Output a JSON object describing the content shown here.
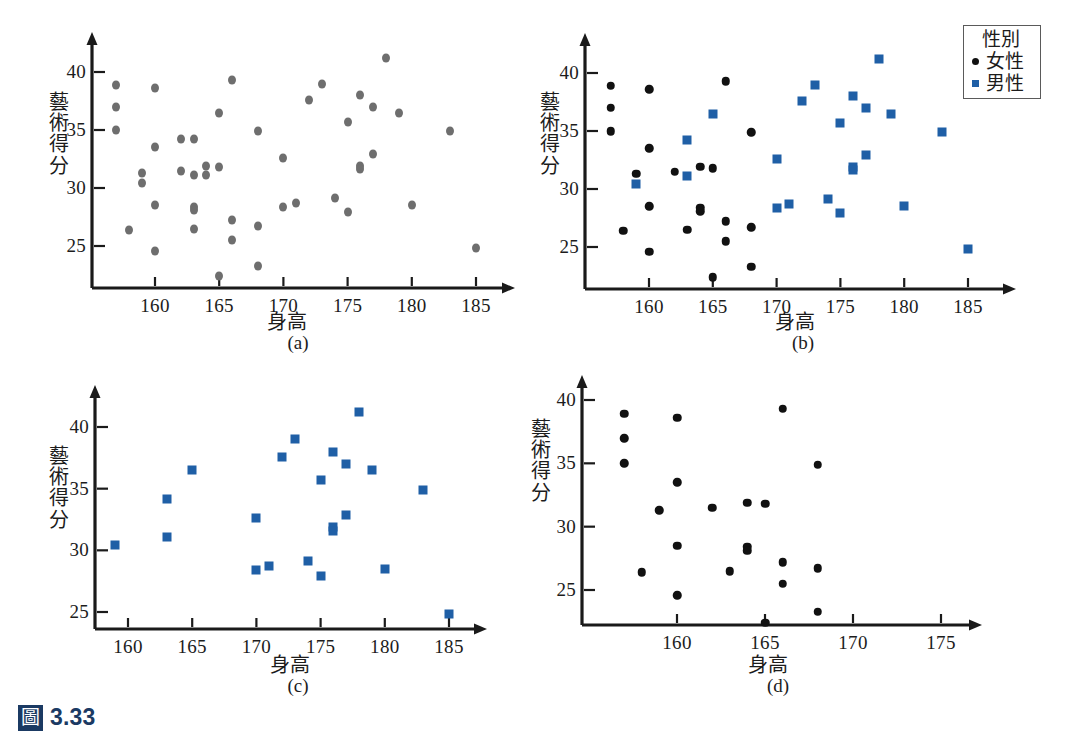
{
  "figure": {
    "badge": "圖",
    "number": "3.33"
  },
  "labels": {
    "x_title": "身高",
    "y_title": "藝術得分",
    "y_title_chars": [
      "藝",
      "術",
      "得",
      "分"
    ]
  },
  "legend": {
    "title": "性別",
    "entries": [
      {
        "label": "女性",
        "marker": "dot",
        "color": "#111111"
      },
      {
        "label": "男性",
        "marker": "square",
        "color": "#1f5fa6"
      }
    ]
  },
  "colors": {
    "grey_marker": "#6e6e6e",
    "black_marker": "#111111",
    "blue_marker": "#1f5fa6",
    "axis": "#1a1a1a",
    "caption_blue": "#1b3a63"
  },
  "chart_data": [
    {
      "id": "a",
      "caption": "(a)",
      "type": "scatter",
      "title": "",
      "xlabel": "身高",
      "ylabel": "藝術得分",
      "xticks": [
        160,
        165,
        170,
        175,
        180,
        185
      ],
      "yticks": [
        25,
        30,
        35,
        40
      ],
      "xlim": [
        156.2,
        186.6
      ],
      "ylim": [
        22.0,
        42.2
      ],
      "grid": false,
      "legend": "none",
      "series": [
        {
          "name": "全部",
          "marker": "dot",
          "color": "#6e6e6e",
          "points": [
            [
              157.0,
              38.9
            ],
            [
              157.0,
              37.0
            ],
            [
              157.0,
              35.0
            ],
            [
              158.0,
              26.4
            ],
            [
              159.0,
              31.3
            ],
            [
              159.0,
              30.4
            ],
            [
              160.0,
              38.6
            ],
            [
              160.0,
              33.5
            ],
            [
              160.0,
              28.5
            ],
            [
              160.0,
              24.6
            ],
            [
              162.0,
              31.5
            ],
            [
              162.0,
              34.2
            ],
            [
              163.0,
              34.2
            ],
            [
              163.0,
              31.1
            ],
            [
              163.0,
              28.4
            ],
            [
              163.0,
              28.1
            ],
            [
              163.0,
              26.5
            ],
            [
              164.0,
              31.9
            ],
            [
              164.0,
              31.1
            ],
            [
              165.0,
              36.5
            ],
            [
              165.0,
              31.8
            ],
            [
              165.0,
              22.4
            ],
            [
              166.0,
              39.3
            ],
            [
              166.0,
              27.2
            ],
            [
              166.0,
              25.5
            ],
            [
              168.0,
              34.9
            ],
            [
              168.0,
              26.7
            ],
            [
              168.0,
              23.3
            ],
            [
              170.0,
              32.6
            ],
            [
              170.0,
              28.4
            ],
            [
              171.0,
              28.7
            ],
            [
              172.0,
              37.6
            ],
            [
              173.0,
              39.0
            ],
            [
              174.0,
              29.1
            ],
            [
              175.0,
              35.7
            ],
            [
              175.0,
              27.9
            ],
            [
              176.0,
              38.0
            ],
            [
              176.0,
              31.9
            ],
            [
              176.0,
              31.6
            ],
            [
              177.0,
              37.0
            ],
            [
              177.0,
              32.9
            ],
            [
              178.0,
              41.2
            ],
            [
              179.0,
              36.5
            ],
            [
              180.0,
              28.5
            ],
            [
              183.0,
              34.9
            ],
            [
              185.0,
              24.8
            ]
          ]
        }
      ]
    },
    {
      "id": "b",
      "caption": "(b)",
      "type": "scatter",
      "title": "",
      "xlabel": "身高",
      "ylabel": "藝術得分",
      "xticks": [
        160,
        165,
        170,
        175,
        180,
        185
      ],
      "yticks": [
        25,
        30,
        35,
        40
      ],
      "xlim": [
        156.2,
        186.6
      ],
      "ylim": [
        22.0,
        42.2
      ],
      "grid": false,
      "legend": "top-right outside",
      "series": [
        {
          "name": "女性",
          "marker": "dot",
          "color": "#111111",
          "points": [
            [
              157.0,
              38.9
            ],
            [
              157.0,
              37.0
            ],
            [
              157.0,
              35.0
            ],
            [
              158.0,
              26.4
            ],
            [
              159.0,
              31.3
            ],
            [
              160.0,
              38.6
            ],
            [
              160.0,
              33.5
            ],
            [
              160.0,
              28.5
            ],
            [
              160.0,
              24.6
            ],
            [
              162.0,
              31.5
            ],
            [
              163.0,
              26.5
            ],
            [
              164.0,
              31.9
            ],
            [
              164.0,
              28.4
            ],
            [
              164.0,
              28.1
            ],
            [
              165.0,
              31.8
            ],
            [
              165.0,
              22.4
            ],
            [
              166.0,
              39.3
            ],
            [
              166.0,
              27.2
            ],
            [
              166.0,
              25.5
            ],
            [
              168.0,
              34.9
            ],
            [
              168.0,
              26.7
            ],
            [
              168.0,
              23.3
            ]
          ]
        },
        {
          "name": "男性",
          "marker": "square",
          "color": "#1f5fa6",
          "points": [
            [
              159.0,
              30.4
            ],
            [
              163.0,
              34.2
            ],
            [
              163.0,
              31.1
            ],
            [
              165.0,
              36.5
            ],
            [
              170.0,
              32.6
            ],
            [
              170.0,
              28.4
            ],
            [
              171.0,
              28.7
            ],
            [
              172.0,
              37.6
            ],
            [
              173.0,
              39.0
            ],
            [
              174.0,
              29.1
            ],
            [
              175.0,
              35.7
            ],
            [
              175.0,
              27.9
            ],
            [
              176.0,
              38.0
            ],
            [
              176.0,
              31.9
            ],
            [
              176.0,
              31.6
            ],
            [
              177.0,
              37.0
            ],
            [
              177.0,
              32.9
            ],
            [
              178.0,
              41.2
            ],
            [
              179.0,
              36.5
            ],
            [
              180.0,
              28.5
            ],
            [
              183.0,
              34.9
            ],
            [
              185.0,
              24.8
            ]
          ]
        }
      ]
    },
    {
      "id": "c",
      "caption": "(c)",
      "type": "scatter",
      "title": "",
      "xlabel": "身高",
      "ylabel": "藝術得分",
      "xticks": [
        160,
        165,
        170,
        175,
        180,
        185
      ],
      "yticks": [
        25,
        30,
        35,
        40
      ],
      "xlim": [
        157.2,
        186.6
      ],
      "ylim": [
        24.0,
        42.4
      ],
      "grid": false,
      "legend": "none",
      "series": [
        {
          "name": "男性",
          "marker": "square",
          "color": "#1f5fa6",
          "points": [
            [
              159.0,
              30.4
            ],
            [
              163.0,
              34.2
            ],
            [
              163.0,
              31.1
            ],
            [
              165.0,
              36.5
            ],
            [
              170.0,
              32.6
            ],
            [
              170.0,
              28.4
            ],
            [
              171.0,
              28.7
            ],
            [
              172.0,
              37.6
            ],
            [
              173.0,
              39.0
            ],
            [
              174.0,
              29.1
            ],
            [
              175.0,
              35.7
            ],
            [
              175.0,
              27.9
            ],
            [
              176.0,
              38.0
            ],
            [
              176.0,
              31.9
            ],
            [
              176.0,
              31.6
            ],
            [
              177.0,
              37.0
            ],
            [
              177.0,
              32.9
            ],
            [
              178.0,
              41.2
            ],
            [
              179.0,
              36.5
            ],
            [
              180.0,
              28.5
            ],
            [
              183.0,
              34.9
            ],
            [
              185.0,
              24.8
            ]
          ]
        }
      ]
    },
    {
      "id": "d",
      "caption": "(d)",
      "type": "scatter",
      "title": "",
      "xlabel": "身高",
      "ylabel": "藝術得分",
      "xticks": [
        160,
        165,
        170,
        175
      ],
      "yticks": [
        25,
        30,
        35,
        40
      ],
      "xlim": [
        156.0,
        176.4
      ],
      "ylim": [
        21.8,
        41.6
      ],
      "grid": false,
      "legend": "none",
      "series": [
        {
          "name": "女性",
          "marker": "dot",
          "color": "#111111",
          "points": [
            [
              157.0,
              38.9
            ],
            [
              157.0,
              37.0
            ],
            [
              157.0,
              35.0
            ],
            [
              158.0,
              26.4
            ],
            [
              159.0,
              31.3
            ],
            [
              160.0,
              38.6
            ],
            [
              160.0,
              33.5
            ],
            [
              160.0,
              28.5
            ],
            [
              160.0,
              24.6
            ],
            [
              162.0,
              31.5
            ],
            [
              163.0,
              26.5
            ],
            [
              164.0,
              31.9
            ],
            [
              164.0,
              28.4
            ],
            [
              164.0,
              28.1
            ],
            [
              165.0,
              31.8
            ],
            [
              165.0,
              22.4
            ],
            [
              166.0,
              39.3
            ],
            [
              166.0,
              27.2
            ],
            [
              166.0,
              25.5
            ],
            [
              168.0,
              34.9
            ],
            [
              168.0,
              26.7
            ],
            [
              168.0,
              23.3
            ]
          ]
        }
      ]
    }
  ]
}
